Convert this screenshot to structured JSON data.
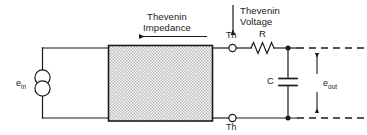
{
  "diagram": {
    "annotations": {
      "impedance_line1": "Thevenin",
      "impedance_line2": "Impedance",
      "voltage_line1": "Thevenin",
      "voltage_line2": "Voltage"
    },
    "terminals": {
      "top_label": "Th",
      "bottom_label": "Th"
    },
    "components": {
      "source_label": "e",
      "source_sub": "in",
      "resistor_label": "R",
      "capacitor_label": "C",
      "output_label": "e",
      "output_sub": "out"
    },
    "colors": {
      "line": "#1a1a1a",
      "box_fill": "#d8d8d8",
      "box_stroke": "#1a1a1a",
      "background": "#ffffff"
    }
  }
}
